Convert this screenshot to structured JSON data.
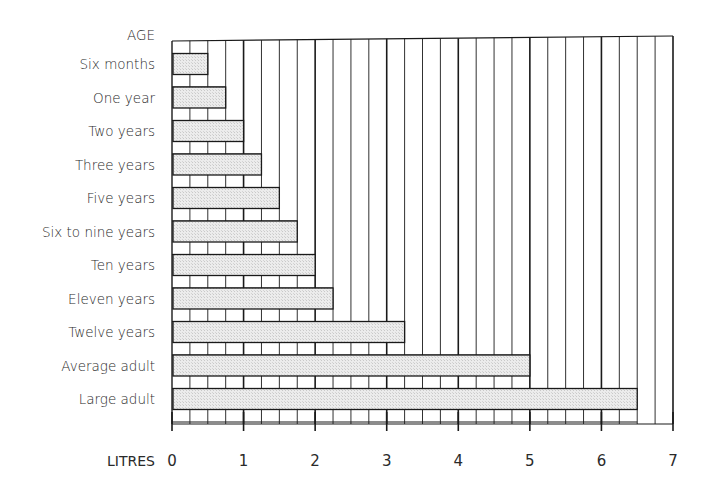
{
  "chart_data": {
    "type": "bar",
    "orientation": "horizontal",
    "title": "",
    "ylabel": "AGE",
    "xlabel": "LITRES",
    "xlim": [
      0,
      7
    ],
    "x_ticks": [
      0,
      1,
      2,
      3,
      4,
      5,
      6,
      7
    ],
    "x_minor_step": 0.25,
    "grid": true,
    "legend": null,
    "categories": [
      "Six months",
      "One year",
      "Two years",
      "Three years",
      "Five years",
      "Six to nine years",
      "Ten years",
      "Eleven years",
      "Twelve years",
      "Average adult",
      "Large adult"
    ],
    "values": [
      0.5,
      0.75,
      1.0,
      1.25,
      1.5,
      1.75,
      2.0,
      2.25,
      3.25,
      5.0,
      6.5
    ],
    "bar_color": "#e6e6e6",
    "line_color": "#1a1a1a"
  }
}
